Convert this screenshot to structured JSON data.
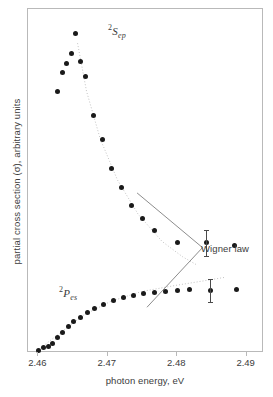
{
  "chart_data": {
    "type": "scatter",
    "title": "",
    "xlabel": "photon energy, eV",
    "ylabel": "partial cross section (σ), arbitrary units",
    "xlim": [
      2.4585,
      2.4925
    ],
    "ylim": [
      0,
      1
    ],
    "xticks": [
      2.46,
      2.47,
      2.48,
      2.49
    ],
    "xtick_labels": [
      "2.46",
      "2.47",
      "2.48",
      "2.49"
    ],
    "yticks": [],
    "ytick_labels": [],
    "grid": false,
    "legend": "none",
    "annotations": [
      {
        "name": "wigner-law",
        "text": "Wigner law",
        "note": "dotted guide curves through both data sets, joined by two leader lines meeting at a point left of the text"
      }
    ],
    "series": [
      {
        "name": "2Sep",
        "label_prefix": "2",
        "label_main": "S",
        "label_sub": "ep",
        "label_text": "²Sₑₚ",
        "marker": "filled-circle",
        "color": "#1a1a1a",
        "points": [
          {
            "x": 2.4628,
            "y": 0.76
          },
          {
            "x": 2.4634,
            "y": 0.815
          },
          {
            "x": 2.464,
            "y": 0.843
          },
          {
            "x": 2.4647,
            "y": 0.872
          },
          {
            "x": 2.4654,
            "y": 0.93
          },
          {
            "x": 2.466,
            "y": 0.846
          },
          {
            "x": 2.4668,
            "y": 0.803
          },
          {
            "x": 2.468,
            "y": 0.69
          },
          {
            "x": 2.4692,
            "y": 0.62
          },
          {
            "x": 2.4706,
            "y": 0.535
          },
          {
            "x": 2.4719,
            "y": 0.481
          },
          {
            "x": 2.4734,
            "y": 0.43
          },
          {
            "x": 2.475,
            "y": 0.39
          },
          {
            "x": 2.4767,
            "y": 0.356
          },
          {
            "x": 2.48,
            "y": 0.322
          },
          {
            "x": 2.4842,
            "y": 0.32
          },
          {
            "x": 2.4882,
            "y": 0.312
          }
        ],
        "error_bars": [
          {
            "x": 2.4842,
            "y": 0.32,
            "err": 0.037
          }
        ]
      },
      {
        "name": "2Pes",
        "label_prefix": "2",
        "label_main": "P",
        "label_sub": "es",
        "label_text": "²Pₑₛ",
        "marker": "filled-circle",
        "color": "#1a1a1a",
        "points": [
          {
            "x": 2.46,
            "y": 0.008
          },
          {
            "x": 2.4607,
            "y": 0.016
          },
          {
            "x": 2.4614,
            "y": 0.018
          },
          {
            "x": 2.4621,
            "y": 0.028
          },
          {
            "x": 2.4628,
            "y": 0.046
          },
          {
            "x": 2.4635,
            "y": 0.06
          },
          {
            "x": 2.4643,
            "y": 0.076
          },
          {
            "x": 2.4651,
            "y": 0.091
          },
          {
            "x": 2.466,
            "y": 0.104
          },
          {
            "x": 2.467,
            "y": 0.119
          },
          {
            "x": 2.4681,
            "y": 0.13
          },
          {
            "x": 2.4694,
            "y": 0.142
          },
          {
            "x": 2.4708,
            "y": 0.152
          },
          {
            "x": 2.4722,
            "y": 0.16
          },
          {
            "x": 2.4737,
            "y": 0.168
          },
          {
            "x": 2.4752,
            "y": 0.172
          },
          {
            "x": 2.4767,
            "y": 0.176
          },
          {
            "x": 2.4783,
            "y": 0.179
          },
          {
            "x": 2.48,
            "y": 0.182
          },
          {
            "x": 2.4818,
            "y": 0.184
          },
          {
            "x": 2.4848,
            "y": 0.182
          },
          {
            "x": 2.4886,
            "y": 0.184
          }
        ],
        "error_bars": [
          {
            "x": 2.4848,
            "y": 0.182,
            "err": 0.034
          }
        ]
      }
    ],
    "guide_curves": [
      {
        "name": "wigner-upper",
        "style": "dotted",
        "color": "#c2c2c2",
        "points": [
          {
            "x": 2.4657,
            "y": 0.9
          },
          {
            "x": 2.467,
            "y": 0.76
          },
          {
            "x": 2.469,
            "y": 0.62
          },
          {
            "x": 2.4715,
            "y": 0.5
          },
          {
            "x": 2.4745,
            "y": 0.4
          },
          {
            "x": 2.478,
            "y": 0.32
          },
          {
            "x": 2.481,
            "y": 0.275
          },
          {
            "x": 2.483,
            "y": 0.252
          }
        ]
      },
      {
        "name": "wigner-lower",
        "style": "dotted",
        "color": "#c2c2c2",
        "points": [
          {
            "x": 2.46,
            "y": 0.004
          },
          {
            "x": 2.463,
            "y": 0.05
          },
          {
            "x": 2.4665,
            "y": 0.104
          },
          {
            "x": 2.4705,
            "y": 0.145
          },
          {
            "x": 2.475,
            "y": 0.174
          },
          {
            "x": 2.48,
            "y": 0.192
          },
          {
            "x": 2.484,
            "y": 0.205
          },
          {
            "x": 2.487,
            "y": 0.215
          }
        ]
      }
    ]
  },
  "axes": {
    "x_title": "photon energy, eV",
    "y_title": "partial cross section (σ), arbitrary units",
    "x_tick_labels": [
      "2.46",
      "2.47",
      "2.48",
      "2.49"
    ]
  },
  "labels": {
    "wigner_law": "Wigner law"
  }
}
